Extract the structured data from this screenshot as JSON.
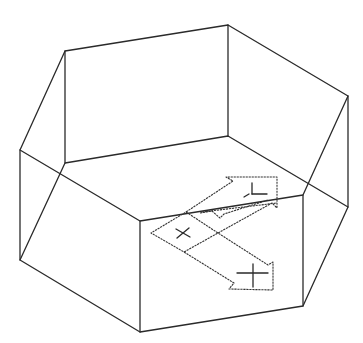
{
  "figure": {
    "background": "#ffffff",
    "line_color": "#2a2a2a",
    "prism": {
      "top_face": [
        [
          20,
          150
        ],
        [
          65,
          51
        ],
        [
          228,
          25
        ],
        [
          348,
          96
        ],
        [
          303,
          195
        ],
        [
          140,
          221
        ]
      ],
      "bottom_face": [
        [
          20,
          260
        ],
        [
          65,
          163
        ],
        [
          228,
          136
        ],
        [
          348,
          207
        ],
        [
          303,
          306
        ],
        [
          140,
          332
        ]
      ]
    },
    "ucs_icon": {
      "origin_marker": "x-mark",
      "axes": [
        "X",
        "Y",
        "Z"
      ]
    }
  }
}
